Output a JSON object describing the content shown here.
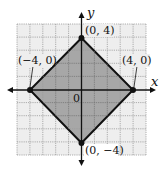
{
  "diagram": {
    "type": "coordinate-plane",
    "title": "",
    "axes": {
      "x_label": "x",
      "y_label": "y",
      "origin_label": "0",
      "xlim": [
        -5,
        5
      ],
      "ylim": [
        -5,
        5
      ],
      "grid": true
    },
    "shape": {
      "kind": "square (rotated 45°)",
      "fill": "#9a9a9a",
      "stroke": "#111111",
      "vertices": [
        {
          "label": "(0, 4)",
          "x": 0,
          "y": 4
        },
        {
          "label": "(4, 0)",
          "x": 4,
          "y": 0
        },
        {
          "label": "(0, −4)",
          "x": 0,
          "y": -4
        },
        {
          "label": "(−4, 0)",
          "x": -4,
          "y": 0
        }
      ]
    },
    "colors": {
      "grid_bg": "#eeeeee",
      "grid_line": "#9a9a9a",
      "axis": "#111111"
    }
  }
}
